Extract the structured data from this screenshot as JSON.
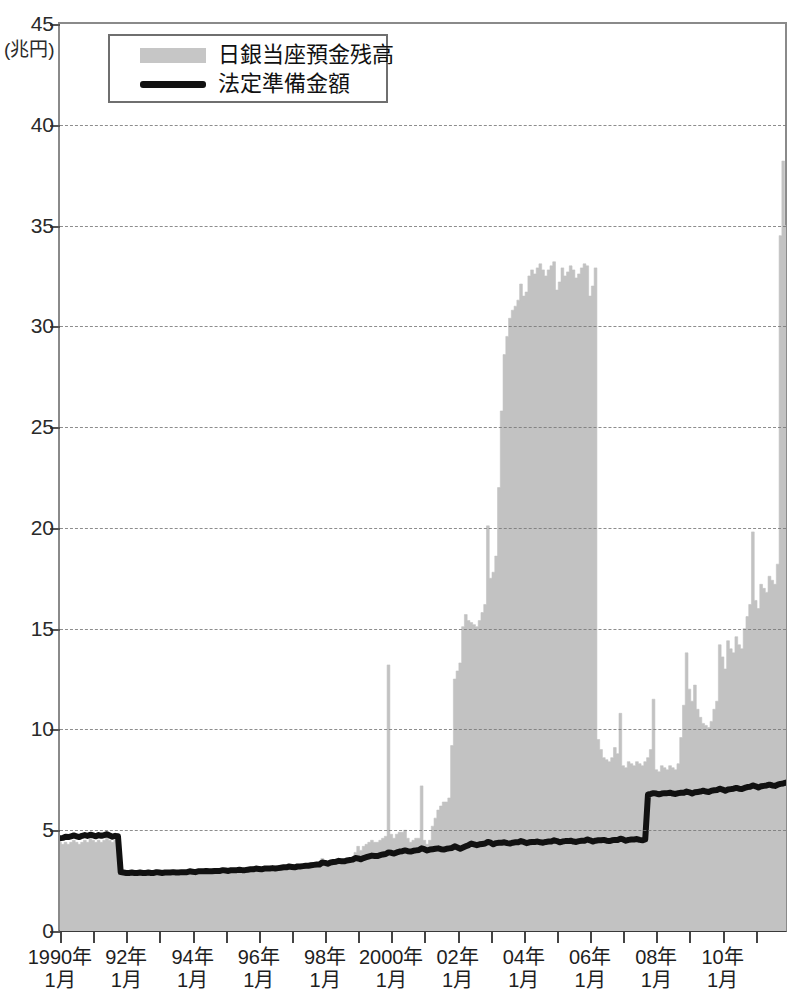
{
  "chart_data": {
    "type": "area",
    "title": "",
    "xlabel": "",
    "ylabel": "",
    "unit_label": "(兆円)",
    "ylim": [
      0,
      45
    ],
    "ytick_values": [
      0,
      5,
      10,
      15,
      20,
      25,
      30,
      35,
      40,
      45
    ],
    "ytick_labels": [
      "0",
      "5",
      "10",
      "15",
      "20",
      "25",
      "30",
      "35",
      "40",
      "45"
    ],
    "grid": true,
    "grid_axis": "y",
    "legend_position": "top-left",
    "xlim": [
      "1990-01",
      "2011-12"
    ],
    "xtick_labels": [
      {
        "line1": "1990年",
        "line2": "1月",
        "x": "1990-01"
      },
      {
        "line1": "92年",
        "line2": "1月",
        "x": "1992-01"
      },
      {
        "line1": "94年",
        "line2": "1月",
        "x": "1994-01"
      },
      {
        "line1": "96年",
        "line2": "1月",
        "x": "1996-01"
      },
      {
        "line1": "98年",
        "line2": "1月",
        "x": "1998-01"
      },
      {
        "line1": "2000年",
        "line2": "1月",
        "x": "2000-01"
      },
      {
        "line1": "02年",
        "line2": "1月",
        "x": "2002-01"
      },
      {
        "line1": "04年",
        "line2": "1月",
        "x": "2004-01"
      },
      {
        "line1": "06年",
        "line2": "1月",
        "x": "2006-01"
      },
      {
        "line1": "08年",
        "line2": "1月",
        "x": "2008-01"
      },
      {
        "line1": "10年",
        "line2": "1月",
        "x": "2010-01"
      }
    ],
    "minor_xticks_every_years": 1,
    "colors": {
      "area_fill": "#c2c2c2",
      "line": "#111111",
      "grid": "#7a7a7a",
      "axis": "#555555",
      "background": "#ffffff"
    },
    "series": [
      {
        "name": "日銀当座預金残高",
        "style": "area",
        "color": "#c2c2c2",
        "x_start": "1990-01",
        "x_step_months": 1,
        "values": [
          4.4,
          4.3,
          4.4,
          4.3,
          4.4,
          4.5,
          4.4,
          4.3,
          4.4,
          4.5,
          4.4,
          4.6,
          4.5,
          4.4,
          4.5,
          4.4,
          4.5,
          4.6,
          4.5,
          4.4,
          4.5,
          4.5,
          2.9,
          2.9,
          2.8,
          2.8,
          2.9,
          2.8,
          2.8,
          2.9,
          2.8,
          2.8,
          2.9,
          2.8,
          2.8,
          3.0,
          2.9,
          2.8,
          2.9,
          2.9,
          2.9,
          2.9,
          2.9,
          2.9,
          2.9,
          2.9,
          2.9,
          3.0,
          3.0,
          2.9,
          3.0,
          3.0,
          3.0,
          3.0,
          3.0,
          3.0,
          3.0,
          3.0,
          3.0,
          3.1,
          3.1,
          3.0,
          3.1,
          3.1,
          3.1,
          3.1,
          3.1,
          3.1,
          3.1,
          3.1,
          3.1,
          3.2,
          3.2,
          3.1,
          3.2,
          3.2,
          3.2,
          3.2,
          3.2,
          3.2,
          3.2,
          3.2,
          3.2,
          3.3,
          3.3,
          3.2,
          3.3,
          3.3,
          3.3,
          3.3,
          3.3,
          3.4,
          3.4,
          3.4,
          3.4,
          3.6,
          3.5,
          3.4,
          3.5,
          3.5,
          3.5,
          3.6,
          3.5,
          3.5,
          3.6,
          3.6,
          3.6,
          3.9,
          4.2,
          4.0,
          4.2,
          4.3,
          4.4,
          4.5,
          4.4,
          4.4,
          4.5,
          4.6,
          4.7,
          13.2,
          4.8,
          4.6,
          4.8,
          4.9,
          4.9,
          5.0,
          4.6,
          4.4,
          4.5,
          4.6,
          4.6,
          7.2,
          4.5,
          4.3,
          4.5,
          5.2,
          5.6,
          6.0,
          6.2,
          6.4,
          6.4,
          6.6,
          9.2,
          12.5,
          12.9,
          13.3,
          15.1,
          15.7,
          15.4,
          15.3,
          15.2,
          15.1,
          15.4,
          15.8,
          16.2,
          20.1,
          17.5,
          17.8,
          18.6,
          22.0,
          25.8,
          28.6,
          29.5,
          30.4,
          30.8,
          31.0,
          31.3,
          32.1,
          31.5,
          31.7,
          32.5,
          32.8,
          32.6,
          32.9,
          33.1,
          32.8,
          32.5,
          32.8,
          33.0,
          33.2,
          31.8,
          32.2,
          32.9,
          32.5,
          32.7,
          33.0,
          32.8,
          32.4,
          32.6,
          32.9,
          33.1,
          33.0,
          31.5,
          32.0,
          32.9,
          9.5,
          9.0,
          8.6,
          8.5,
          8.4,
          8.6,
          9.1,
          8.8,
          10.8,
          8.2,
          8.1,
          8.4,
          8.3,
          8.2,
          8.4,
          8.3,
          8.2,
          8.4,
          8.6,
          9.0,
          11.5,
          8.0,
          7.9,
          8.2,
          8.1,
          8.0,
          8.2,
          8.1,
          8.0,
          8.3,
          9.6,
          11.2,
          13.8,
          12.0,
          11.4,
          12.2,
          11.0,
          10.6,
          10.3,
          10.2,
          10.1,
          10.4,
          11.0,
          11.4,
          14.2,
          13.6,
          13.0,
          14.4,
          14.0,
          13.8,
          14.6,
          14.2,
          14.0,
          15.0,
          15.6,
          16.2,
          19.8,
          16.4,
          16.0,
          17.2,
          17.0,
          16.8,
          17.6,
          17.4,
          17.2,
          18.2,
          34.5,
          38.2,
          35.0
        ]
      },
      {
        "name": "法定準備金額",
        "style": "line",
        "color": "#111111",
        "x_start": "1990-01",
        "x_step_months": 1,
        "values": [
          4.6,
          4.62,
          4.68,
          4.66,
          4.7,
          4.74,
          4.7,
          4.66,
          4.72,
          4.76,
          4.72,
          4.78,
          4.74,
          4.7,
          4.76,
          4.72,
          4.76,
          4.8,
          4.74,
          4.68,
          4.72,
          4.7,
          2.92,
          2.9,
          2.88,
          2.88,
          2.9,
          2.88,
          2.88,
          2.9,
          2.88,
          2.88,
          2.9,
          2.88,
          2.88,
          2.92,
          2.9,
          2.88,
          2.9,
          2.9,
          2.9,
          2.92,
          2.9,
          2.9,
          2.92,
          2.92,
          2.92,
          2.96,
          2.94,
          2.92,
          2.96,
          2.96,
          2.96,
          2.98,
          2.96,
          2.96,
          2.98,
          2.98,
          2.98,
          3.02,
          3.0,
          2.98,
          3.02,
          3.02,
          3.02,
          3.04,
          3.02,
          3.02,
          3.04,
          3.06,
          3.06,
          3.1,
          3.08,
          3.06,
          3.1,
          3.1,
          3.1,
          3.12,
          3.1,
          3.12,
          3.14,
          3.16,
          3.16,
          3.2,
          3.18,
          3.16,
          3.2,
          3.2,
          3.22,
          3.24,
          3.24,
          3.26,
          3.28,
          3.3,
          3.3,
          3.4,
          3.38,
          3.34,
          3.4,
          3.42,
          3.44,
          3.48,
          3.46,
          3.46,
          3.5,
          3.52,
          3.54,
          3.62,
          3.6,
          3.56,
          3.62,
          3.66,
          3.7,
          3.74,
          3.72,
          3.72,
          3.76,
          3.8,
          3.82,
          3.9,
          3.88,
          3.84,
          3.9,
          3.94,
          3.96,
          4.0,
          3.96,
          3.94,
          3.98,
          4.0,
          4.02,
          4.1,
          4.06,
          4.0,
          4.04,
          4.06,
          4.08,
          4.1,
          4.06,
          4.04,
          4.08,
          4.1,
          4.12,
          4.2,
          4.14,
          4.08,
          4.14,
          4.2,
          4.26,
          4.34,
          4.3,
          4.26,
          4.3,
          4.32,
          4.34,
          4.42,
          4.38,
          4.3,
          4.36,
          4.38,
          4.38,
          4.4,
          4.36,
          4.34,
          4.38,
          4.4,
          4.4,
          4.46,
          4.42,
          4.36,
          4.4,
          4.42,
          4.42,
          4.44,
          4.4,
          4.38,
          4.42,
          4.44,
          4.44,
          4.5,
          4.46,
          4.4,
          4.44,
          4.46,
          4.46,
          4.48,
          4.44,
          4.42,
          4.46,
          4.48,
          4.48,
          4.54,
          4.5,
          4.44,
          4.48,
          4.5,
          4.5,
          4.52,
          4.48,
          4.46,
          4.5,
          4.52,
          4.52,
          4.58,
          4.54,
          4.48,
          4.52,
          4.54,
          4.54,
          4.56,
          4.52,
          4.5,
          4.54,
          6.78,
          6.8,
          6.84,
          6.82,
          6.78,
          6.82,
          6.84,
          6.84,
          6.86,
          6.82,
          6.8,
          6.84,
          6.86,
          6.86,
          6.92,
          6.88,
          6.82,
          6.88,
          6.9,
          6.92,
          6.96,
          6.92,
          6.9,
          6.96,
          6.98,
          7.0,
          7.06,
          7.02,
          6.96,
          7.02,
          7.04,
          7.06,
          7.1,
          7.06,
          7.04,
          7.1,
          7.14,
          7.16,
          7.22,
          7.18,
          7.12,
          7.18,
          7.2,
          7.22,
          7.26,
          7.22,
          7.2,
          7.26,
          7.3,
          7.32,
          7.36
        ]
      }
    ],
    "annotations": [
      {
        "label": "Y2K spike",
        "x": "1999-12",
        "value": 13.2
      },
      {
        "label": "quantitative easing peak",
        "x": "2004-07",
        "value": 33.1
      },
      {
        "label": "final spike",
        "x": "2011-11",
        "value": 38.2
      }
    ]
  },
  "legend": {
    "items": [
      {
        "label": "日銀当座預金残高",
        "marker": "bar-swatch"
      },
      {
        "label": "法定準備金額",
        "marker": "line-swatch"
      }
    ]
  },
  "caption": ""
}
